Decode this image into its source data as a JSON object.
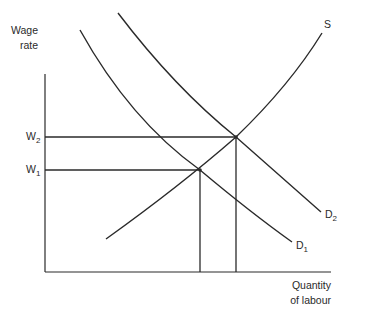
{
  "diagram": {
    "type": "labour-market-supply-demand",
    "axes": {
      "y_label_line1": "Wage",
      "y_label_line2": "rate",
      "x_label_line1": "Quantity",
      "x_label_line2": "of labour"
    },
    "wage_levels": [
      {
        "base": "W",
        "sub": "2"
      },
      {
        "base": "W",
        "sub": "1"
      }
    ],
    "curves": {
      "supply": {
        "label": "S"
      },
      "demand_1": {
        "base": "D",
        "sub": "1"
      },
      "demand_2": {
        "base": "D",
        "sub": "2"
      }
    },
    "colors": {
      "line": "#2a2a2a",
      "background": "#ffffff"
    }
  }
}
